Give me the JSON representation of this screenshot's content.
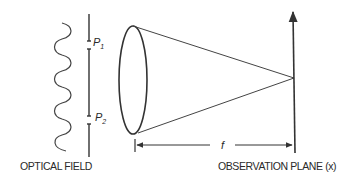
{
  "diagram": {
    "labels": {
      "optical_field": "OPTICAL FIELD",
      "observation_plane": "OBSERVATION PLANE (x)",
      "p1_letter": "P",
      "p1_sub": "1",
      "p2_letter": "P",
      "p2_sub": "2",
      "focal_length": "f"
    },
    "colors": {
      "stroke": "#333333",
      "background": "#ffffff"
    }
  }
}
